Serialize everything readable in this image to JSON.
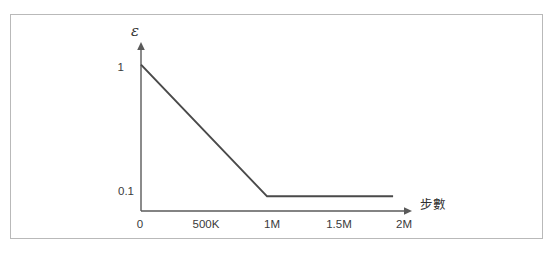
{
  "figure": {
    "frame_color": "#b9b9b9",
    "background": "#ffffff"
  },
  "axes": {
    "y_title": "ε",
    "x_title": "步數",
    "line_color": "#4a4a4a",
    "axis_color": "#5a5a5a"
  },
  "chart_data": {
    "type": "line",
    "title": "",
    "subtitle": "",
    "xlabel": "步數",
    "ylabel": "ε",
    "x": [
      0,
      1000000,
      2000000
    ],
    "values": [
      1,
      0.1,
      0.1
    ],
    "series": [
      {
        "name": "epsilon",
        "x": [
          0,
          1000000,
          2000000
        ],
        "values": [
          1,
          0.1,
          0.1
        ]
      }
    ],
    "xlim": [
      0,
      2150000
    ],
    "ylim": [
      0,
      1.12
    ],
    "xticks": [
      0,
      500000,
      1000000,
      1500000,
      2000000
    ],
    "xticklabels": [
      "0",
      "500K",
      "1M",
      "1.5M",
      "2M"
    ],
    "yticks": [
      0.1,
      1
    ],
    "yticklabels": [
      "0.1",
      "1"
    ],
    "grid": false,
    "legend": false,
    "annotations": []
  }
}
